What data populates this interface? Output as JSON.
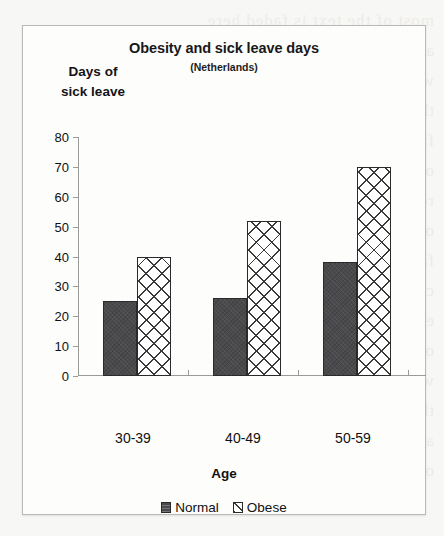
{
  "chart_data": {
    "type": "bar",
    "title": "Obesity and sick leave days",
    "subtitle": "(Netherlands)",
    "xlabel": "Age",
    "ylabel": "Days of sick leave",
    "ylabel_line1": "Days of",
    "ylabel_line2": "sick leave",
    "categories": [
      "30-39",
      "40-49",
      "50-59"
    ],
    "series": [
      {
        "name": "Normal",
        "values": [
          25,
          26,
          38
        ]
      },
      {
        "name": "Obese",
        "values": [
          40,
          52,
          70
        ]
      }
    ],
    "ylim": [
      0,
      80
    ],
    "ytick_values": [
      80,
      70,
      60,
      50,
      40,
      30,
      20,
      10,
      0
    ],
    "ytick_labels": [
      "80",
      "70",
      "60",
      "50",
      "40",
      "30",
      "20",
      "10",
      "0"
    ],
    "grid": false,
    "legend_position": "bottom",
    "colors": {
      "normal_fill": "#4a4a4c",
      "obese_fill": "#ffffff",
      "bar_outline": "#2a2a2a",
      "axis": "#9a9a98",
      "text": "#111111",
      "panel_background": "#fdfdfc",
      "panel_border": "#b9b9b5",
      "page_background": "#f7f7f5"
    }
  },
  "legend": {
    "items": [
      {
        "label": "Normal",
        "swatch": "solid-dark-square-icon"
      },
      {
        "label": "Obese",
        "swatch": "hatched-square-icon"
      }
    ]
  },
  "background_bleed": {
    "lines": [
      "most of the text is faded here",
      "and illegible on this scan page",
      "with partial words showing up",
      "through the thin paper sheet",
      "from the reverse printed side",
      "of the original document page",
      "reading is not possible here",
      "only shapes of letters remain",
      "faint traces of typed letters",
      "continue down the whole page",
      "ending near the bottom edge",
      "of this scanned paper sheet",
      "with a few more faint lines",
      "that cannot be made out now",
      "at the very bottom margin",
      "of the page being scanned"
    ]
  }
}
